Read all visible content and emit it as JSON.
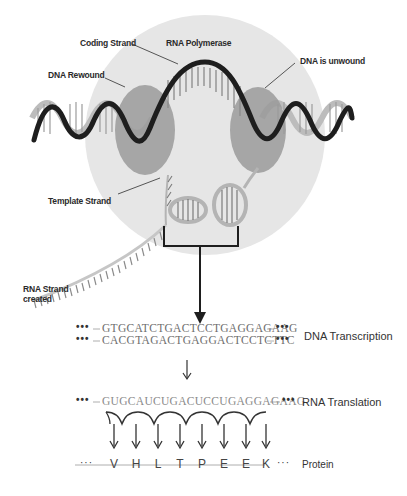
{
  "labels": {
    "coding_strand": "Coding Strand",
    "rna_polymerase": "RNA Polymerase",
    "dna_rewound": "DNA Rewound",
    "dna_unwound": "DNA is unwound",
    "template_strand": "Template Strand",
    "rna_strand_created_line1": "RNA Strand",
    "rna_strand_created_line2": "created"
  },
  "sequences": {
    "coding": "GTGCATCTGACTCCTGAGGAGAAG",
    "template": "CACGTAGACTGAGGACTCCTCTTC",
    "rna": "GUGCAUCUGACUCCUGAGGAGAAG",
    "ellipsis": "•••",
    "protein_ellipsis": "···"
  },
  "stages": {
    "transcription": "DNA Transcription",
    "translation": "RNA Translation",
    "protein": "Protein"
  },
  "protein": [
    "V",
    "H",
    "L",
    "T",
    "P",
    "E",
    "E",
    "K"
  ],
  "colors": {
    "polymerase_bg": "#e6e6e6",
    "enzyme_blob": "#9a9a9a",
    "helix_dark": "#1e1e1e",
    "helix_light": "#bcbcbc",
    "sequence_text": "#6e6e6e"
  }
}
